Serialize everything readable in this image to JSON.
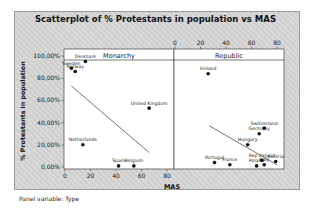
{
  "chart_data": {
    "type": "scatter",
    "title": "Scatterplot of % Protestants in population vs MAS",
    "xlabel": "MAS",
    "ylabel": "% Protestants in population",
    "panel_variable": "Panel variable: Type",
    "x_ticks": [
      0,
      20,
      40,
      60,
      80
    ],
    "y_ticks": [
      "0,00%",
      "20,00%",
      "40,00%",
      "60,00%",
      "80,00%",
      "100,00%"
    ],
    "xlim": [
      0,
      85
    ],
    "ylim": [
      0,
      100
    ],
    "panels": [
      {
        "name": "Monarchy",
        "points": [
          {
            "label": "Sweden",
            "x": 5,
            "y": 89
          },
          {
            "label": "Denmark",
            "x": 16,
            "y": 95
          },
          {
            "label": "Norway",
            "x": 8,
            "y": 86
          },
          {
            "label": "United Kingdom",
            "x": 66,
            "y": 53
          },
          {
            "label": "Netherlands",
            "x": 14,
            "y": 20
          },
          {
            "label": "Spain",
            "x": 42,
            "y": 1
          },
          {
            "label": "Belgium",
            "x": 54,
            "y": 1
          }
        ],
        "fit_line": {
          "x1": 5,
          "y1": 73,
          "x2": 66,
          "y2": 13
        }
      },
      {
        "name": "Republic",
        "points": [
          {
            "label": "Finland",
            "x": 26,
            "y": 84
          },
          {
            "label": "Switzerland",
            "x": 70,
            "y": 35
          },
          {
            "label": "Germany",
            "x": 66,
            "y": 30
          },
          {
            "label": "Hungary",
            "x": 57,
            "y": 20
          },
          {
            "label": "Portugal",
            "x": 31,
            "y": 4
          },
          {
            "label": "France",
            "x": 43,
            "y": 2
          },
          {
            "label": "Rep Ireland",
            "x": 68,
            "y": 6
          },
          {
            "label": "Austria",
            "x": 79,
            "y": 5
          },
          {
            "label": "Poland",
            "x": 64,
            "y": 1
          },
          {
            "label": "Italy",
            "x": 70,
            "y": 2
          }
        ],
        "fit_line": {
          "x1": 27,
          "y1": 37,
          "x2": 80,
          "y2": 2
        }
      }
    ]
  }
}
